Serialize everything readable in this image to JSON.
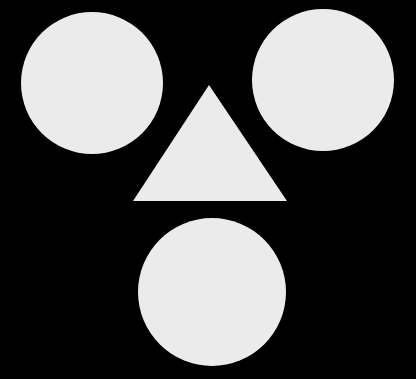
{
  "canvas": {
    "width": 416,
    "height": 379,
    "background_color": "#000000",
    "title": "Three circles and a triangle on black background"
  },
  "palette": {
    "background": "#000000",
    "shape_fill": "#ebebeb",
    "shape_fill_alt": "#e9e9e9"
  },
  "shapes": [
    {
      "id": "circle-top-left",
      "name": "top-left-circle",
      "type": "circle",
      "fill": "#ebebeb",
      "center_x": 92,
      "center_y": 83,
      "radius": 71
    },
    {
      "id": "circle-top-right",
      "name": "top-right-circle",
      "type": "circle",
      "fill": "#ebebeb",
      "center_x": 323,
      "center_y": 80,
      "radius": 71
    },
    {
      "id": "circle-bottom-center",
      "name": "bottom-center-circle",
      "type": "circle",
      "fill": "#ebebeb",
      "center_x": 212,
      "center_y": 292,
      "radius": 74
    },
    {
      "id": "triangle-center",
      "name": "center-triangle",
      "type": "triangle",
      "fill": "#ebebeb",
      "points": "209,85 287,201 133,201",
      "apex_x": 209,
      "apex_y": 85,
      "base_left_x": 133,
      "base_right_x": 287,
      "base_y": 201
    }
  ]
}
